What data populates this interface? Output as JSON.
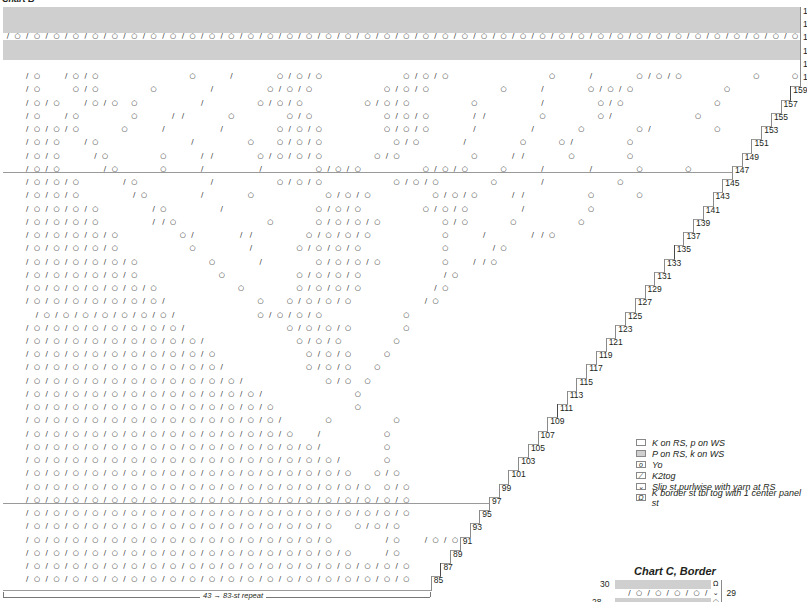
{
  "chart_b": {
    "title": "Chart B",
    "grid": {
      "origin_x": 3,
      "origin_y": 7,
      "cell_w": 9.72,
      "cell_h": 6.62,
      "total_cols": 82,
      "repeat_boundaries": [
        8,
        20,
        32,
        44,
        56,
        68,
        80
      ]
    },
    "top_rows": [
      {
        "label": "171",
        "type": "purl"
      },
      {
        "label": "",
        "type": "purl"
      },
      {
        "label": "169",
        "type": "purl"
      },
      {
        "label": "",
        "type": "purl"
      },
      {
        "label": "167",
        "type": "yo_k2tog"
      },
      {
        "label": "",
        "type": "purl"
      },
      {
        "label": "165",
        "type": "purl"
      },
      {
        "label": "",
        "type": "purl"
      },
      {
        "label": "163",
        "type": "knit"
      },
      {
        "label": "",
        "type": "knit"
      }
    ],
    "rs_rows": [
      {
        "label": "161",
        "cols": 82,
        "p": "../o../o/o.........o.../....o/o/o........o/o/o..........o.../....o/o/o.......o...o"
      },
      {
        "label": "159",
        "cols": 81,
        "p": "../o...o/o.....o...../.....o/o/o.......o/o/o.......o.../....o/o/o.........o"
      },
      {
        "label": "157",
        "cols": 80,
        "p": "../o/o../o/o.o....../.....o/o/o......o/o/o......o....../.....o/o.........o"
      },
      {
        "label": "155",
        "cols": 79,
        "p": "../o../o.....o...//....o.....o/o.......o/o/o....//.....o.....o/........o"
      },
      {
        "label": "153",
        "cols": 78,
        "p": "../o/o/o....o.../...../.....o/o/o......o/o/o..../...../....o.....o/......o"
      },
      {
        "label": "151",
        "cols": 77,
        "p": "../o/o../o........./.....o..o/o/o.......o/o..../.....o...o/.....o"
      },
      {
        "label": "149",
        "cols": 76,
        "p": "../o/o.../o.....o...//....o/o/o/o.....o/o.......o...//....o.....o"
      },
      {
        "label": "147",
        "cols": 75,
        "p": "../o/o..../o....o.../...../.....o/o/o......o/o/o...o.../..../....o....o"
      },
      {
        "label": "145",
        "cols": 74,
        "p": "../o/o/o..../o......./......o/o/o.......o/o/o.....o..../.......o"
      },
      {
        "label": "143",
        "cols": 73,
        "p": "../o/o/o...../o...../....o.......o/o/o......o/o/o...//......o....o"
      },
      {
        "label": "141",
        "cols": 72,
        "p": "../o/o/o/o...../o...../.........o/o/o......o/o/o...../......o"
      },
      {
        "label": "139",
        "cols": 71,
        "p": "../o/o/o/o.....//o.........o....o/o/o/o......o/o....o......o"
      },
      {
        "label": "137",
        "cols": 70,
        "p": "../o/o/o/o/o......o/....//.....o/o/o/o.......o.../....//o"
      },
      {
        "label": "135",
        "cols": 69,
        "p": "../o/o/o/o/o.......o...../....o/o/o/o........o..../o"
      },
      {
        "label": "133",
        "cols": 68,
        "p": "../o/o/o/o/o/o.......o..../.....o/o/o/o......o..//o"
      },
      {
        "label": "131",
        "cols": 67,
        "p": "../o/o/o/o/o/o........o.......o/o/o/o......../o"
      },
      {
        "label": "129",
        "cols": 66,
        "p": "../o/o/o/o/o/o/o........o.....o/o/o/o......./o"
      },
      {
        "label": "127",
        "cols": 65,
        "p": "../o/o/o/o/o/o/o/.........o..o/o/o/o......./o"
      },
      {
        "label": "125",
        "cols": 64,
        "p": ".../o/o/o/o/o/o/o/........o/o/o/o........o"
      },
      {
        "label": "123",
        "cols": 63,
        "p": "../o/o/o/o/o/o/o/o/..........o/o/o/o.....o"
      },
      {
        "label": "121",
        "cols": 62,
        "p": "../o/o/o/o/o/o/o/o/o/.........o/o/o.....o"
      },
      {
        "label": "119",
        "cols": 61,
        "p": "../o/o/o/o/o/o/o/o/o/o.........o/o/o...o"
      },
      {
        "label": "117",
        "cols": 60,
        "p": "../o/o/o/o/o/o/o/o/o/o/........o/o/o..o"
      },
      {
        "label": "115",
        "cols": 59,
        "p": "../o/o/o/o/o/o/o/o/o/o/o/........o/o.o"
      },
      {
        "label": "113",
        "cols": 58,
        "p": "../o/o/o/o/o/o/o/o/o/o/o/o/.........o"
      },
      {
        "label": "111",
        "cols": 57,
        "p": "../o/o/o/o/o/o/o/o/o/o/o/o/o........o"
      },
      {
        "label": "109",
        "cols": 56,
        "p": "../o/o/o/o/o/o/o/o/o/o/o/o/o/....o......o"
      },
      {
        "label": "107",
        "cols": 55,
        "p": "../o/o/o/o/o/o/o/o/o/o/o/o/o/o../......o"
      },
      {
        "label": "105",
        "cols": 54,
        "p": "../o/o/o/o/o/o/o/o/o/o/o/o/o/o/o/......o"
      },
      {
        "label": "103",
        "cols": 53,
        "p": "../o/o/o/o/o/o/o/o/o/o/o/o/o/o/o/o/....o"
      },
      {
        "label": "101",
        "cols": 52,
        "p": "../o/o/o/o/o/o/o/o/o/o/o/o/o/o/o/o/o..o/o"
      },
      {
        "label": "99",
        "cols": 51,
        "p": "../o/o/o/o/o/o/o/o/o/o/o/o/o/o/o/o/o/o.o/o"
      },
      {
        "label": "97",
        "cols": 50,
        "p": "../o/o/o/o/o/o/o/o/o/o/o/o/o/o/o/o/o/o/o/o"
      },
      {
        "label": "95",
        "cols": 49,
        "p": "../o/o/o/o/o/o/o/o/o/o/o/o/o/o/o/o/o/o/o/o"
      },
      {
        "label": "93",
        "cols": 48,
        "p": "../o/o/o/o/o/o/o/o/o/o/o/o/o/o/o/o..o/o/o"
      },
      {
        "label": "91",
        "cols": 47,
        "p": "../o/o/o/o/o/o/o/o/o/o/o/o/o/o/o/o...../o../o/o...o"
      },
      {
        "label": "89",
        "cols": 46,
        "p": "../o/o/o/o/o/o/o/o/o/o/o/o/o/o/o/o/o.../o.......o"
      },
      {
        "label": "87",
        "cols": 45,
        "p": "../o/o/o/o/o/o/o/o/o/o/o/o/o/o/o/o/o/o/o/o.....o"
      },
      {
        "label": "85",
        "cols": 44,
        "p": "../o/o/o/o/o/o/o/o/o/o/o/o/o/o/o/o/o/o/o/o.....o"
      }
    ],
    "repeat": {
      "label": "43 → 83-st repeat",
      "x_start": 3,
      "x_end": 430,
      "y": 597
    }
  },
  "legend": {
    "items": [
      {
        "swatch": "white",
        "glyph": "",
        "label": "K on RS, p on WS"
      },
      {
        "swatch": "gray",
        "glyph": "",
        "label": "P on RS, k on WS"
      },
      {
        "swatch": "white",
        "glyph": "o",
        "label": "Yo"
      },
      {
        "swatch": "white",
        "glyph": "∕",
        "label": "K2tog"
      },
      {
        "swatch": "white",
        "glyph": "⌄",
        "label": "Slip st purlwise with yarn at RS"
      },
      {
        "swatch": "white",
        "glyph": "Ω",
        "label": "K border st tbl tog with 1 center panel st"
      }
    ]
  },
  "chart_c": {
    "title": "Chart C, Border",
    "rows": [
      {
        "label_left": "30",
        "label_right": "",
        "cells": [
          "p",
          "p",
          "p",
          "p",
          "p",
          "p",
          "p",
          "p",
          "p",
          "p",
          "Ω"
        ]
      },
      {
        "label_left": "",
        "label_right": "29",
        "cells": [
          ".",
          "/",
          "o",
          "/",
          "o",
          "/",
          "o",
          "/",
          "o",
          "/",
          "⌄"
        ]
      },
      {
        "label_left": "28",
        "label_right": "",
        "cells": [
          "p",
          "p",
          "p",
          "p",
          "p",
          "p",
          "p",
          "p",
          "p",
          "p",
          "o"
        ]
      }
    ]
  },
  "colors": {
    "purl_gray": "#cfcfcf",
    "grid_line": "#8a8a8a",
    "repeat_line": "#4a4a4a",
    "text": "#231f20"
  }
}
